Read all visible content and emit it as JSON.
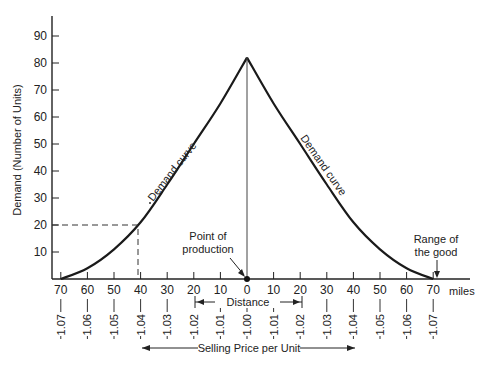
{
  "chart_data": {
    "type": "line",
    "title": "",
    "ylabel": "Demand (Number of Units)",
    "xlabel": "Distance",
    "x_unit": "miles",
    "secondary_xlabel": "Selling Price per Unit",
    "ylim": [
      0,
      95
    ],
    "y_ticks": [
      10,
      20,
      30,
      40,
      50,
      60,
      70,
      80,
      90
    ],
    "x_ticks": [
      70,
      60,
      50,
      40,
      30,
      20,
      10,
      0,
      10,
      20,
      30,
      40,
      50,
      60,
      70
    ],
    "x_positions": [
      -70,
      -60,
      -50,
      -40,
      -30,
      -20,
      -10,
      0,
      10,
      20,
      30,
      40,
      50,
      60,
      70
    ],
    "price_ticks": [
      "1.07",
      "1.06",
      "1.05",
      "1.04",
      "1.03",
      "1.02",
      "1.01",
      "1.00",
      "1.01",
      "1.02",
      "1.03",
      "1.04",
      "1.05",
      "1.06",
      "1.07"
    ],
    "grid": false,
    "legend": null,
    "series": [
      {
        "name": "Demand curve",
        "x": [
          -70,
          -60,
          -50,
          -40,
          -30,
          -20,
          -10,
          0,
          10,
          20,
          30,
          40,
          50,
          60,
          70
        ],
        "values": [
          0,
          4,
          11,
          21,
          35,
          50,
          65,
          82,
          65,
          50,
          35,
          21,
          11,
          4,
          0
        ]
      }
    ],
    "annotations": [
      {
        "text": "Demand curve",
        "position": "left branch"
      },
      {
        "text": "Demand curve",
        "position": "right branch"
      },
      {
        "text": "Point of production",
        "x": 0,
        "y": 0
      },
      {
        "text": "Range of the good",
        "x": 70,
        "y": 0
      },
      {
        "text": "Distance",
        "span": [
          -20,
          20
        ]
      },
      {
        "text": "Selling Price per Unit",
        "span": [
          -40,
          40
        ]
      },
      {
        "text": "reference line",
        "x": -40,
        "y": 20,
        "style": "dashed"
      }
    ]
  },
  "labels": {
    "ylabel": "Demand (Number of Units)",
    "left_curve": "Demand curve",
    "right_curve": "Demand curve",
    "point_production_1": "Point of",
    "point_production_2": "production",
    "range_1": "Range of",
    "range_2": "the good",
    "distance": "Distance",
    "price": "Selling Price per Unit",
    "miles": "miles"
  }
}
